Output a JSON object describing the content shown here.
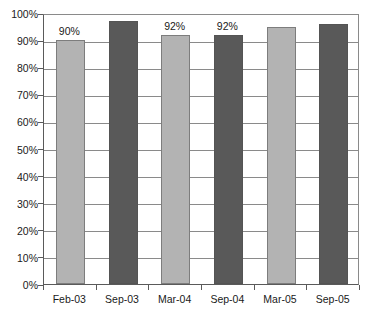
{
  "chart_data": {
    "type": "bar",
    "title": "",
    "subtitle": "",
    "xlabel": "",
    "ylabel": "",
    "categories": [
      "Feb-03",
      "Sep-03",
      "Mar-04",
      "Sep-04",
      "Mar-05",
      "Sep-05"
    ],
    "values": [
      90,
      97,
      92,
      92,
      95,
      96
    ],
    "data_labels": [
      "90%",
      null,
      "92%",
      "92%",
      null,
      null
    ],
    "bar_colors": [
      "#b3b3b3",
      "#595959",
      "#b3b3b3",
      "#595959",
      "#b3b3b3",
      "#595959"
    ],
    "ylim": [
      0,
      100
    ],
    "ytick_values": [
      0,
      10,
      20,
      30,
      40,
      50,
      60,
      70,
      80,
      90,
      100
    ],
    "ytick_labels": [
      "0%",
      "10%",
      "20%",
      "30%",
      "40%",
      "50%",
      "60%",
      "70%",
      "80%",
      "90%",
      "100%"
    ],
    "grid": true,
    "grid_color": "#8a8a8a",
    "legend": null,
    "legend_position": "none",
    "plot_background": "#ffffff",
    "axis_color": "#5a5a5a"
  }
}
